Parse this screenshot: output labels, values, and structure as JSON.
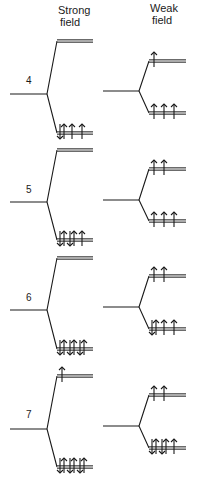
{
  "headers": {
    "strong_line1": "Strong",
    "strong_line2": "field",
    "weak_line1": "Weak",
    "weak_line2": "field"
  },
  "configurations": [
    {
      "d_electrons": "4",
      "strong_field": {
        "eg_upper": {
          "up": 0,
          "down": 0
        },
        "t2g_lower": {
          "up": 3,
          "down": 1
        },
        "spin": "low-spin"
      },
      "weak_field": {
        "eg_upper": {
          "up": 1,
          "down": 0
        },
        "t2g_lower": {
          "up": 3,
          "down": 0
        },
        "spin": "high-spin"
      }
    },
    {
      "d_electrons": "5",
      "strong_field": {
        "eg_upper": {
          "up": 0,
          "down": 0
        },
        "t2g_lower": {
          "up": 3,
          "down": 2
        },
        "spin": "low-spin"
      },
      "weak_field": {
        "eg_upper": {
          "up": 2,
          "down": 0
        },
        "t2g_lower": {
          "up": 3,
          "down": 0
        },
        "spin": "high-spin"
      }
    },
    {
      "d_electrons": "6",
      "strong_field": {
        "eg_upper": {
          "up": 0,
          "down": 0
        },
        "t2g_lower": {
          "up": 3,
          "down": 3
        },
        "spin": "low-spin"
      },
      "weak_field": {
        "eg_upper": {
          "up": 2,
          "down": 0
        },
        "t2g_lower": {
          "up": 3,
          "down": 1
        },
        "spin": "high-spin"
      }
    },
    {
      "d_electrons": "7",
      "strong_field": {
        "eg_upper": {
          "up": 1,
          "down": 0
        },
        "t2g_lower": {
          "up": 3,
          "down": 3
        },
        "spin": "low-spin"
      },
      "weak_field": {
        "eg_upper": {
          "up": 2,
          "down": 0
        },
        "t2g_lower": {
          "up": 3,
          "down": 2
        },
        "spin": "high-spin"
      }
    }
  ],
  "colors": {
    "line": "#1a1a1a",
    "level": "#3a3a3a"
  }
}
